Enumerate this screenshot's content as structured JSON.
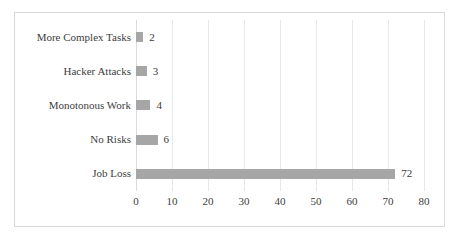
{
  "chart_data": {
    "type": "bar",
    "orientation": "horizontal",
    "title": "",
    "xlabel": "",
    "ylabel": "",
    "categories": [
      "More Complex Tasks",
      "Hacker Attacks",
      "Monotonous Work",
      "No Risks",
      "Job Loss"
    ],
    "values": [
      2,
      3,
      4,
      6,
      72
    ],
    "data_labels": [
      "2",
      "3",
      "4",
      "6",
      "72"
    ],
    "xlim": [
      0,
      80
    ],
    "xticks": [
      0,
      10,
      20,
      30,
      40,
      50,
      60,
      70,
      80
    ],
    "xtick_labels": [
      "0",
      "10",
      "20",
      "30",
      "40",
      "50",
      "60",
      "70",
      "80"
    ],
    "grid": "vertical",
    "legend": "none",
    "bar_color": "#a6a6a6",
    "gridline_color": "#e8e8e8",
    "border_color": "#d9d9d9",
    "text_color": "#3d3d3d"
  }
}
